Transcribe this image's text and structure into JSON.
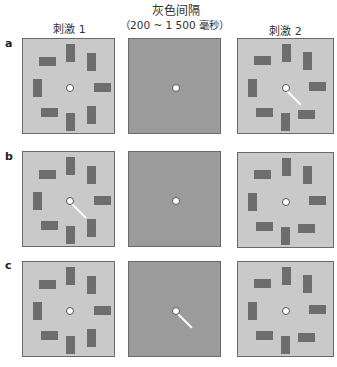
{
  "header": {
    "title": "灰色间隔",
    "interval": "（200 ~ 1 500 毫秒）",
    "stimulus1": "刺激 1",
    "stimulus2": "刺激 2"
  },
  "rows": [
    {
      "label": "a",
      "cue_panel": "stimulus2",
      "changed_item": "none"
    },
    {
      "label": "b",
      "cue_panel": "stimulus1",
      "changed_item": "lower-right bar vertical→horizontal"
    },
    {
      "label": "c",
      "cue_panel": "gray-interval",
      "changed_item": "lower-right bar vertical→horizontal"
    }
  ],
  "colors": {
    "stimulus_background": "#c9c9c9",
    "interval_background": "#9b9b9b",
    "bar": "#6d6d6d",
    "fixation": "#ffffff",
    "cue_line": "#ffffff"
  }
}
